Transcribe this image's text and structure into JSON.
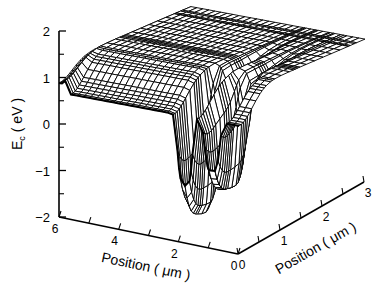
{
  "chart_data": {
    "type": "surface3d",
    "title": "",
    "zlabel": "E_c ( eV )",
    "zlabel_main": "E",
    "zlabel_sub": "c",
    "zlabel_units": "( eV )",
    "xlabel": "Position ( μm )",
    "ylabel": "Position ( μm )",
    "zlim": [
      -2,
      2
    ],
    "xlim": [
      0,
      6
    ],
    "ylim": [
      0,
      3
    ],
    "z_ticks": [
      2,
      1,
      0,
      -1,
      -2
    ],
    "z_tick_labels": [
      "2",
      "1",
      "0",
      "−1",
      "−2"
    ],
    "x_ticks": [
      6,
      5,
      4,
      3,
      2,
      1,
      0
    ],
    "x_tick_labels": [
      "6",
      "",
      "4",
      "",
      "2",
      "",
      "0"
    ],
    "y_ticks": [
      0,
      0.5,
      1,
      1.5,
      2,
      2.5,
      3
    ],
    "y_tick_labels": [
      "0",
      "",
      "1",
      "",
      "2",
      "",
      "3"
    ],
    "grid": false,
    "legend": null,
    "surface": {
      "description": "Conduction band edge vs 2D position: ~1.35–1.6 eV plateau with a channel near y≈0 and two potential wells near x≈1.8 μm (≈−1.4 eV) and x≈0.9 μm (≈−0.8 eV)",
      "plateau_eV": 1.45,
      "channel_eV": 0.75,
      "wells": [
        {
          "x_um": 1.8,
          "y_um": 0.35,
          "min_eV": -1.4
        },
        {
          "x_um": 0.9,
          "y_um": 0.35,
          "min_eV": -0.8
        }
      ]
    }
  },
  "colors": {
    "line": "#000000",
    "fill": "#ffffff",
    "background": "#ffffff"
  }
}
